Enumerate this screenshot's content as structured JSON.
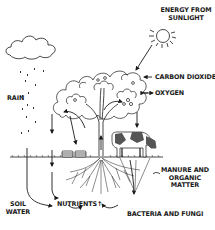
{
  "diagram": {
    "type": "nutrient-cycle",
    "colors": {
      "ink": "#1a1a1a",
      "cow_dark": "#555555",
      "background": "#ffffff"
    },
    "labels": {
      "energy_line1": "ENERGY FROM",
      "energy_line2": "SUNLIGHT",
      "carbon_dioxide": "CARBON DIOXIDE",
      "oxygen": "OXYGEN",
      "rain": "RAIN",
      "manure_line1": "MANURE AND",
      "manure_line2": "ORGANIC",
      "manure_line3": "MATTER",
      "soil_line1": "SOIL",
      "soil_line2": "WATER",
      "nutrients": "NUTRIENTS",
      "nutrients_arrow": "↑",
      "bacteria": "BACTERIA AND FUNGI"
    },
    "elements": [
      "sun",
      "cloud",
      "rain-drops",
      "tree",
      "roots",
      "cow",
      "baskets",
      "ground-line",
      "arrows"
    ]
  }
}
